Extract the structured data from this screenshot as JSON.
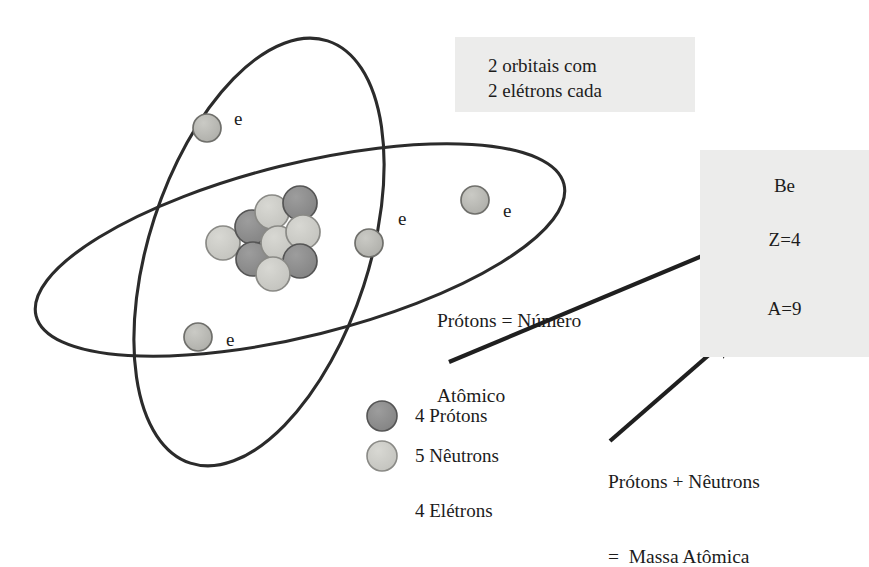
{
  "figure": {
    "colors": {
      "proton": "#8b8b8b",
      "neutron": "#c9c9c4",
      "electron": "#b9b9b4",
      "orbit_stroke": "#2b2b2b",
      "particle_stroke": "#4a4a4a",
      "arrow": "#1f1f1f",
      "box_background": "#ececeb",
      "text": "#1c1c1c",
      "page_background": "#ffffff"
    }
  },
  "orbit_note": {
    "line1": "2 orbitais com",
    "line2": "2 elétrons cada"
  },
  "element_box": {
    "symbol": "Be",
    "atomic_number": "Z=4",
    "mass_number": "A=9"
  },
  "annotations": {
    "protons_equals": {
      "line1": "Prótons = Número",
      "line2": "Atômico"
    },
    "mass_equals": {
      "line1": "Prótons + Nêutrons",
      "line2": "=  Massa Atômica"
    }
  },
  "legend": {
    "items": [
      {
        "swatch": "proton",
        "label": "4 Prótons"
      },
      {
        "swatch": "neutron",
        "label": "5 Nêutrons"
      }
    ],
    "electrons_label": "4 Elétrons"
  },
  "electrons": [
    {
      "name": "electron-upper-left",
      "label": "e",
      "cx": 207,
      "cy": 128,
      "r": 14,
      "lx": 234,
      "ly": 108
    },
    {
      "name": "electron-center",
      "label": "e",
      "cx": 369,
      "cy": 243,
      "r": 14,
      "lx": 398,
      "ly": 208
    },
    {
      "name": "electron-right",
      "label": "e",
      "cx": 475,
      "cy": 200,
      "r": 14,
      "lx": 503,
      "ly": 200
    },
    {
      "name": "electron-lower-left",
      "label": "e",
      "cx": 198,
      "cy": 337,
      "r": 14,
      "lx": 226,
      "ly": 329
    }
  ],
  "nucleus": {
    "particles": [
      {
        "type": "neutron",
        "cx": 223,
        "cy": 243,
        "r": 17
      },
      {
        "type": "proton",
        "cx": 252,
        "cy": 227,
        "r": 17
      },
      {
        "type": "proton",
        "cx": 253,
        "cy": 259,
        "r": 17
      },
      {
        "type": "neutron",
        "cx": 272,
        "cy": 212,
        "r": 17
      },
      {
        "type": "neutron",
        "cx": 278,
        "cy": 243,
        "r": 17
      },
      {
        "type": "proton",
        "cx": 300,
        "cy": 203,
        "r": 17
      },
      {
        "type": "neutron",
        "cx": 303,
        "cy": 232,
        "r": 17
      },
      {
        "type": "proton",
        "cx": 300,
        "cy": 261,
        "r": 17
      },
      {
        "type": "neutron",
        "cx": 273,
        "cy": 274,
        "r": 17
      }
    ]
  },
  "arrows": [
    {
      "name": "arrow-atomic-number",
      "x1": 449,
      "y1": 362,
      "x2": 757,
      "y2": 233
    },
    {
      "name": "arrow-mass-number",
      "x1": 610,
      "y1": 441,
      "x2": 733,
      "y2": 334
    }
  ]
}
